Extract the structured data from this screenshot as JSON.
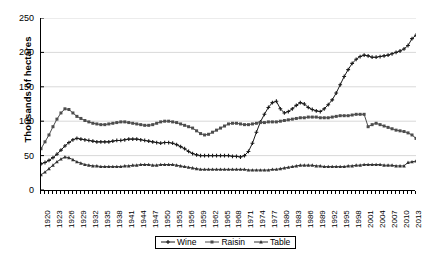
{
  "chart_data": {
    "type": "line",
    "title": "",
    "xlabel": "",
    "ylabel": "Thousands of hectares",
    "ylim": [
      0,
      250
    ],
    "yticks": [
      0,
      50,
      100,
      150,
      200,
      250
    ],
    "grid": true,
    "legend_position": "bottom-center",
    "xlim": [
      1920,
      2014
    ],
    "x_tick_step": 3,
    "x": [
      1920,
      1921,
      1922,
      1923,
      1924,
      1925,
      1926,
      1927,
      1928,
      1929,
      1930,
      1931,
      1932,
      1933,
      1934,
      1935,
      1936,
      1937,
      1938,
      1939,
      1940,
      1941,
      1942,
      1943,
      1944,
      1945,
      1946,
      1947,
      1948,
      1949,
      1950,
      1951,
      1952,
      1953,
      1954,
      1955,
      1956,
      1957,
      1958,
      1959,
      1960,
      1961,
      1962,
      1963,
      1964,
      1965,
      1966,
      1967,
      1968,
      1969,
      1970,
      1971,
      1972,
      1973,
      1974,
      1975,
      1976,
      1977,
      1978,
      1979,
      1980,
      1981,
      1982,
      1983,
      1984,
      1985,
      1986,
      1987,
      1988,
      1989,
      1990,
      1991,
      1992,
      1993,
      1994,
      1995,
      1996,
      1997,
      1998,
      1999,
      2000,
      2001,
      2002,
      2003,
      2004,
      2005,
      2006,
      2007,
      2008,
      2009,
      2010,
      2011,
      2012,
      2013,
      2014
    ],
    "xtick_labels": [
      "1920",
      "1923",
      "1926",
      "1929",
      "1932",
      "1935",
      "1938",
      "1941",
      "1944",
      "1947",
      "1950",
      "1953",
      "1956",
      "1959",
      "1962",
      "1965",
      "1968",
      "1971",
      "1974",
      "1977",
      "1980",
      "1983",
      "1986",
      "1989",
      "1992",
      "1995",
      "1998",
      "2001",
      "2004",
      "2007",
      "2010",
      "2013"
    ],
    "series": [
      {
        "name": "Wine",
        "marker": "plus",
        "color": "#1a1a1a",
        "values": [
          38,
          40,
          43,
          47,
          52,
          58,
          64,
          69,
          73,
          75,
          74,
          73,
          72,
          71,
          70,
          70,
          70,
          70,
          71,
          72,
          72,
          73,
          74,
          74,
          74,
          73,
          72,
          71,
          70,
          69,
          68,
          69,
          69,
          68,
          66,
          63,
          60,
          56,
          53,
          51,
          50,
          50,
          50,
          50,
          50,
          50,
          50,
          50,
          49,
          49,
          48,
          50,
          56,
          68,
          84,
          99,
          110,
          120,
          127,
          129,
          118,
          112,
          114,
          118,
          123,
          127,
          125,
          120,
          117,
          115,
          114,
          118,
          124,
          131,
          141,
          153,
          165,
          175,
          184,
          190,
          194,
          196,
          195,
          193,
          193,
          194,
          195,
          196,
          198,
          200,
          202,
          205,
          210,
          220,
          225
        ]
      },
      {
        "name": "Raisin",
        "marker": "square",
        "color": "#4d4d4d",
        "values": [
          60,
          70,
          80,
          92,
          103,
          112,
          118,
          117,
          112,
          107,
          104,
          101,
          99,
          97,
          96,
          95,
          95,
          96,
          97,
          98,
          99,
          99,
          98,
          97,
          96,
          95,
          94,
          94,
          95,
          97,
          99,
          100,
          100,
          99,
          98,
          96,
          94,
          92,
          90,
          86,
          82,
          80,
          81,
          84,
          87,
          90,
          93,
          96,
          97,
          97,
          96,
          95,
          95,
          96,
          97,
          98,
          98,
          99,
          99,
          99,
          100,
          101,
          102,
          103,
          104,
          105,
          105,
          106,
          106,
          106,
          105,
          105,
          105,
          106,
          107,
          108,
          108,
          108,
          109,
          110,
          110,
          110,
          92,
          95,
          97,
          95,
          93,
          91,
          89,
          87,
          86,
          85,
          83,
          80,
          75
        ]
      },
      {
        "name": "Table",
        "marker": "triangle",
        "color": "#333333",
        "values": [
          22,
          26,
          31,
          36,
          41,
          45,
          48,
          47,
          44,
          41,
          39,
          37,
          36,
          35,
          35,
          34,
          34,
          34,
          34,
          34,
          34,
          35,
          35,
          36,
          36,
          37,
          37,
          37,
          36,
          36,
          37,
          37,
          37,
          37,
          36,
          35,
          34,
          33,
          32,
          31,
          30,
          30,
          30,
          30,
          30,
          30,
          30,
          30,
          30,
          30,
          30,
          30,
          29,
          29,
          29,
          29,
          29,
          29,
          30,
          30,
          31,
          32,
          33,
          34,
          35,
          36,
          36,
          36,
          36,
          35,
          35,
          34,
          34,
          34,
          34,
          34,
          34,
          35,
          35,
          36,
          36,
          37,
          37,
          37,
          37,
          37,
          36,
          36,
          36,
          35,
          35,
          35,
          40,
          41,
          42
        ]
      }
    ]
  },
  "legend": {
    "items": [
      {
        "label": "Wine"
      },
      {
        "label": "Raisin"
      },
      {
        "label": "Table"
      }
    ]
  }
}
